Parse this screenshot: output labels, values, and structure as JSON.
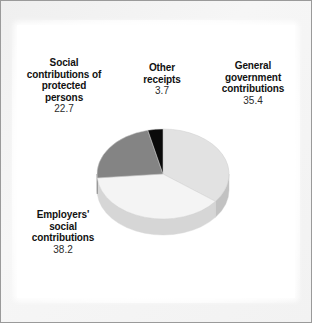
{
  "figure": {
    "type": "pie-chart-figure",
    "background_color": "#ffffff",
    "frame_color": "#9a9a9a"
  },
  "labels": {
    "protected": {
      "line1": "Social",
      "line2": "contributions of",
      "line3": "protected",
      "line4": "persons",
      "value": "22.7"
    },
    "other": {
      "line1": "Other",
      "line2": "receipts",
      "value": "3.7"
    },
    "general": {
      "line1": "General",
      "line2": "government",
      "line3": "contributions",
      "value": "35.4"
    },
    "employers": {
      "line1": "Employers'",
      "line2": "social",
      "line3": "contributions",
      "value": "38.2"
    }
  },
  "chart_data": {
    "type": "pie",
    "title": "",
    "subtitle": "",
    "xlabel": "",
    "ylabel": "",
    "grid": false,
    "legend_position": "outside-labels",
    "style": "3d-exploded-none",
    "start_angle_deg": -90,
    "direction": "clockwise",
    "total": 100.0,
    "units": "percent",
    "categories": [
      "General government contributions",
      "Employers' social contributions",
      "Social contributions of protected persons",
      "Other receipts"
    ],
    "values": [
      35.4,
      38.2,
      22.7,
      3.7
    ],
    "value_labels": [
      "35.4",
      "38.2",
      "22.7",
      "3.7"
    ],
    "colors": [
      "#e2e2e2",
      "#f4f4f4",
      "#848484",
      "#0a0a0a"
    ],
    "side_colors": [
      "#c2c2c2",
      "#d6d6d6",
      "#6a6a6a",
      "#000000"
    ],
    "slices": [
      {
        "name": "General government contributions",
        "value": 35.4,
        "value_label": "35.4",
        "color": "#e2e2e2",
        "start_deg": 0.0,
        "end_deg": 127.44,
        "label_position": "right"
      },
      {
        "name": "Employers' social contributions",
        "value": 38.2,
        "value_label": "38.2",
        "color": "#f4f4f4",
        "start_deg": 127.44,
        "end_deg": 264.96,
        "label_position": "bottom-left"
      },
      {
        "name": "Social contributions of protected persons",
        "value": 22.7,
        "value_label": "22.7",
        "color": "#848484",
        "start_deg": 264.96,
        "end_deg": 346.68,
        "label_position": "top-left"
      },
      {
        "name": "Other receipts",
        "value": 3.7,
        "value_label": "3.7",
        "color": "#0a0a0a",
        "start_deg": 346.68,
        "end_deg": 360.0,
        "label_position": "top-center"
      }
    ]
  }
}
